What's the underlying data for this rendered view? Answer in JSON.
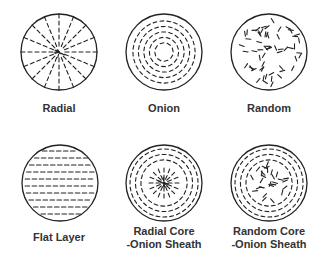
{
  "diagram": {
    "panels": [
      {
        "id": "radial",
        "label": "Radial",
        "pattern": "radial",
        "cx": 59,
        "cy": 52,
        "label_lines": [
          "Radial"
        ]
      },
      {
        "id": "onion",
        "label": "Onion",
        "pattern": "onion",
        "cx": 164,
        "cy": 52,
        "label_lines": [
          "Onion"
        ]
      },
      {
        "id": "random",
        "label": "Random",
        "pattern": "random",
        "cx": 269,
        "cy": 52,
        "label_lines": [
          "Random"
        ]
      },
      {
        "id": "flat-layer",
        "label": "Flat Layer",
        "pattern": "flat",
        "cx": 60,
        "cy": 183,
        "label_lines": [
          "Flat Layer"
        ]
      },
      {
        "id": "radial-core-onion-sheath",
        "label": "Radial Core -Onion Sheath",
        "pattern": "radial-onion",
        "cx": 164,
        "cy": 183,
        "label_lines": [
          "Radial Core",
          "-Onion Sheath"
        ]
      },
      {
        "id": "random-core-onion-sheath",
        "label": "Random Core -Onion Sheath",
        "pattern": "random-onion",
        "cx": 269,
        "cy": 183,
        "label_lines": [
          "Random Core",
          "-Onion Sheath"
        ]
      }
    ],
    "radius": 38,
    "stroke_color": "#222222"
  }
}
